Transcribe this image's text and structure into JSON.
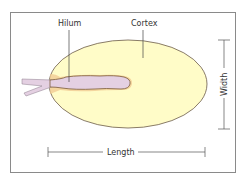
{
  "diagram": {
    "labels": {
      "hilum": "Hilum",
      "cortex": "Cortex",
      "width": "Width",
      "length": "Length"
    },
    "colors": {
      "frame": "#8a8a8a",
      "cortex_fill": "#fffcc8",
      "cortex_stroke": "#6b5a4a",
      "hilum_fill": "#e4d0e2",
      "hilum_stroke": "#7a5a3a",
      "hilum_halo": "#f0c890",
      "leader_line": "#444444",
      "dimension_line": "#555555"
    }
  }
}
